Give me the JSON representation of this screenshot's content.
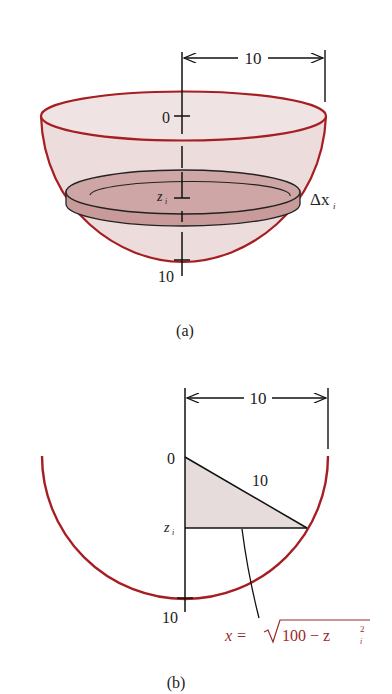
{
  "figure_a": {
    "caption": "(a)",
    "dimension_label": "10",
    "axis_top_label": "0",
    "axis_bottom_label": "10",
    "slice_depth_label": "z",
    "slice_depth_subscript": "i",
    "slice_thickness_label": "Δx",
    "slice_thickness_subscript": "i"
  },
  "figure_b": {
    "caption": "(b)",
    "dimension_label": "10",
    "axis_top_label": "0",
    "axis_bottom_label": "10",
    "hypotenuse_label": "10",
    "slice_depth_label": "z",
    "slice_depth_subscript": "i",
    "equation_lhs": "x =",
    "equation_radicand": "100 − z",
    "equation_sup": "2",
    "equation_sub": "i"
  },
  "colors": {
    "outline_red": "#a61e22",
    "bowl_fill": "#ecdcdc",
    "disk_fill": "#c99a9a",
    "triangle_fill": "#e6dcdc",
    "ink": "#111111"
  }
}
